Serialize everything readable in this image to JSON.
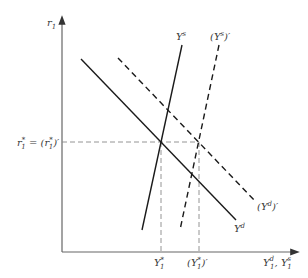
{
  "diagram": {
    "type": "supply-demand",
    "y_axis": {
      "label": "r",
      "label_sub": "1"
    },
    "x_axis": {
      "label_main": "Y",
      "sup1": "d",
      "sub1": "1",
      "sep": ", ",
      "label_main2": "Y",
      "sup2": "s",
      "sub2": "1"
    },
    "r_star_label": {
      "left": "r",
      "left_sub": "1",
      "left_sup": "*",
      "eq": " = (",
      "right": "r",
      "right_sub": "1",
      "right_sup": "*",
      "close": ")′"
    },
    "x_ticks": [
      {
        "name": "Y1-star",
        "base": "Y",
        "sup": "*",
        "sub": "1"
      },
      {
        "name": "Y1-star-prime",
        "open": "(",
        "base": "Y",
        "sup": "*",
        "sub": "1",
        "close": ")′"
      }
    ],
    "curves": [
      {
        "name": "Yd",
        "label": "Y",
        "sup": "d",
        "style": "solid"
      },
      {
        "name": "Yd-prime",
        "label": "(Y",
        "sup": "d",
        "close": ")′",
        "style": "dashed"
      },
      {
        "name": "Ys",
        "label": "Y",
        "sup": "s",
        "style": "solid"
      },
      {
        "name": "Ys-prime",
        "label": "(Y",
        "sup": "s",
        "close": ")′",
        "style": "dashed"
      }
    ],
    "colors": {
      "axis": "#555555",
      "line": "#1a1a1a",
      "guide": "#777777",
      "text": "#3a3a3a"
    }
  }
}
